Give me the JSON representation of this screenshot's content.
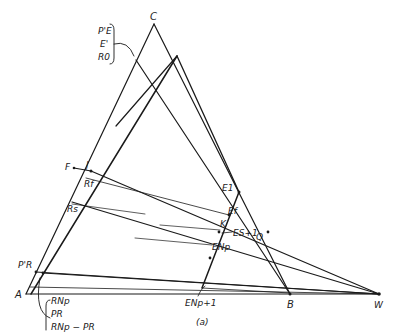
{
  "figure": {
    "caption": "(a)",
    "colors": {
      "ink": "#1a1a1a",
      "background": "#ffffff"
    }
  },
  "vertices": {
    "C": "C",
    "A": "A",
    "B": "B",
    "W": "W"
  },
  "points": {
    "F": "F",
    "J": "J",
    "Rf": "Rf",
    "Rs": "Rs",
    "PR_prime": "P'R",
    "E1": "E1",
    "Ef": "Ef",
    "K": "K",
    "Es1": "ES+1",
    "ENp": "ENp",
    "ENp1": "ENp+1",
    "Q": "Q"
  },
  "groups": {
    "top_left": [
      "P'E",
      "E'",
      "R0"
    ],
    "bottom_left": [
      "RNp",
      "PR",
      "RNp − PR"
    ]
  }
}
